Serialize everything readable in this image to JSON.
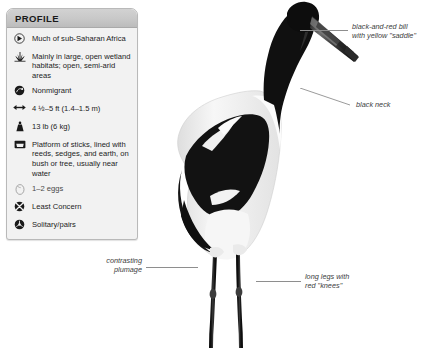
{
  "profile": {
    "title": "PROFILE",
    "rows": [
      {
        "icon": "range-globe-icon",
        "text": "Much of\nsub-Saharan Africa",
        "dim": false
      },
      {
        "icon": "habitat-grass-icon",
        "text": "Mainly in large, open\nwetland habitats;\nopen, semi-arid areas",
        "dim": false
      },
      {
        "icon": "migration-arrow-icon",
        "text": "Nonmigrant",
        "dim": false
      },
      {
        "icon": "length-arrows-icon",
        "text": "4 ½–5 ft (1.4–1.5 m)",
        "dim": false
      },
      {
        "icon": "weight-icon",
        "text": "13 lb (6 kg)",
        "dim": false
      },
      {
        "icon": "nest-icon",
        "text": "Platform of sticks, lined\nwith reeds, sedges, and\nearth, on bush or tree,\nusually near water",
        "dim": false
      },
      {
        "icon": "egg-icon",
        "text": "1–2 eggs",
        "dim": true
      },
      {
        "icon": "conservation-status-icon",
        "text": "Least Concern",
        "dim": false
      },
      {
        "icon": "social-pair-icon",
        "text": "Solitary/pairs",
        "dim": false
      }
    ]
  },
  "annotations": [
    {
      "name": "bill",
      "text": "black-and-red bill\nwith yellow \"saddle\""
    },
    {
      "name": "neck",
      "text": "black neck"
    },
    {
      "name": "plumage",
      "text": "contrasting\nplumage"
    },
    {
      "name": "legs",
      "text": "long legs with\nred \"knees\""
    }
  ],
  "subject": {
    "name": "saddle-billed-stork",
    "colors": {
      "plumage_black": "#111111",
      "plumage_white": "#f4f4f4",
      "bill_red": "#6d6d6d",
      "leader_line": "#8e8e8e",
      "card_border": "#b9b9b9",
      "card_header": "#c8c8c8",
      "card_body": "#f2f2f2"
    }
  }
}
